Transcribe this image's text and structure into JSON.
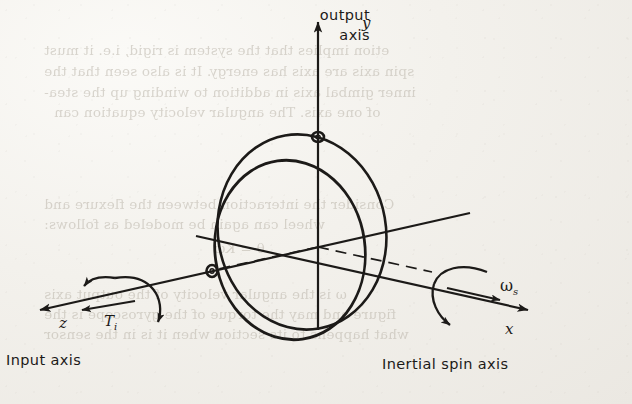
{
  "figure": {
    "kind": "gyroscope-axes-diagram",
    "background": "#f4f2ee",
    "ink_color": "#1c1a18",
    "ghost_text_color": "#b9b3a8"
  },
  "labels": {
    "output_axis_line1": "output",
    "output_axis_line2": "axis",
    "y_axis": "y",
    "z_axis": "z",
    "x_axis": "x",
    "input_torque": "T",
    "input_torque_sub": "i",
    "spin_rate": "ω",
    "spin_rate_sub": "s",
    "input_axis": "Input axis",
    "inertial_spin_axis": "Inertial spin axis"
  },
  "ghost_text": [
    {
      "text": "etion implies that the system is rigid, i.e. it must",
      "x": 44,
      "y": 42
    },
    {
      "text": "spin axis are axis has energy. It is also seen that the",
      "x": 44,
      "y": 63
    },
    {
      "text": "inner gimbal axis in addition to winding up the stea-",
      "x": 44,
      "y": 84
    },
    {
      "text": "of one axis. The angular velocity equation can",
      "x": 54,
      "y": 104
    },
    {
      "text": "Consider the interaction between the flexure and",
      "x": 44,
      "y": 196
    },
    {
      "text": "wheel can again be modeled as follows:",
      "x": 44,
      "y": 216
    },
    {
      "text": "θ = Kω",
      "x": 214,
      "y": 240
    },
    {
      "text": "ω is the angular velocity of the output axis",
      "x": 44,
      "y": 286
    },
    {
      "text": "figure and may the torque of the gyroscope is the",
      "x": 44,
      "y": 306
    },
    {
      "text": "what happens to its section when it is in the sensor",
      "x": 44,
      "y": 326
    }
  ],
  "geometry": {
    "origin": {
      "x": 318,
      "y": 247
    },
    "y_axis_tip": {
      "x": 318,
      "y": 16
    },
    "z_axis_tip": {
      "x": 32,
      "y": 311
    },
    "x_axis_tip": {
      "x": 536,
      "y": 312
    },
    "outer_ring": {
      "cx": 302,
      "cy": 232,
      "rx": 84,
      "ry": 98,
      "rotation": -10
    },
    "inner_rotor": {
      "cx": 290,
      "cy": 250,
      "rx": 75,
      "ry": 90,
      "rotation": -8
    },
    "pivot_top": {
      "x": 318,
      "y": 137,
      "r": 5
    },
    "pivot_left": {
      "x": 212,
      "y": 271,
      "r": 5
    }
  }
}
